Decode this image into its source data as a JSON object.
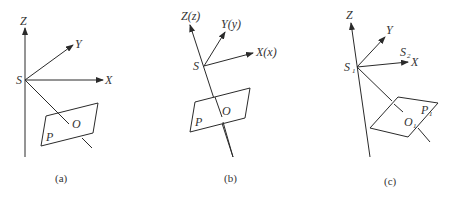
{
  "figure": {
    "panels": [
      {
        "id": "a",
        "caption": "(a)",
        "labels": {
          "z": "Z",
          "y": "Y",
          "x": "X",
          "s": "S",
          "o": "O",
          "p": "P"
        }
      },
      {
        "id": "b",
        "caption": "(b)",
        "labels": {
          "z": "Z(z)",
          "y": "Y(y)",
          "x": "X(x)",
          "s": "S",
          "o": "O",
          "p": "P"
        }
      },
      {
        "id": "c",
        "caption": "(c)",
        "labels": {
          "z": "Z",
          "y": "Y",
          "x": "X",
          "s": "S",
          "s_sub": "1",
          "s2": "S",
          "s2_sub": "2",
          "o": "O",
          "o_sub": "1",
          "p": "P",
          "p_sub": "1"
        }
      }
    ]
  }
}
